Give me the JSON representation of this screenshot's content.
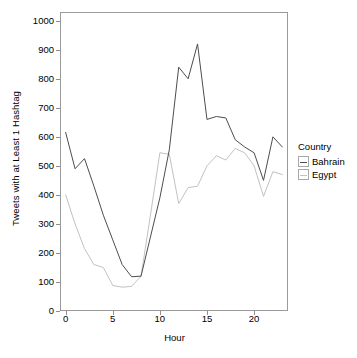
{
  "chart_data": {
    "type": "line",
    "title": "",
    "xlabel": "Hour",
    "ylabel": "Tweets with at Least 1 Hashtag",
    "xlim": [
      -0.6,
      23.6
    ],
    "ylim": [
      0,
      1030
    ],
    "xticks": [
      0,
      5,
      10,
      15,
      20
    ],
    "yticks": [
      0,
      100,
      200,
      300,
      400,
      500,
      600,
      700,
      800,
      900,
      1000
    ],
    "grid": false,
    "legend_position": "right",
    "legend_title": "Country",
    "x": [
      0,
      1,
      2,
      3,
      4,
      5,
      6,
      7,
      8,
      9,
      10,
      11,
      12,
      13,
      14,
      15,
      16,
      17,
      18,
      19,
      20,
      21,
      22,
      23
    ],
    "series": [
      {
        "name": "Bahrain",
        "color": "#4d4d4d",
        "values": [
          615,
          490,
          525,
          430,
          330,
          245,
          160,
          118,
          120,
          255,
          390,
          555,
          840,
          800,
          920,
          660,
          670,
          665,
          590,
          565,
          545,
          450,
          600,
          565
        ]
      },
      {
        "name": "Egypt",
        "color": "#c2c2c2",
        "values": [
          400,
          300,
          215,
          160,
          150,
          88,
          82,
          85,
          120,
          330,
          545,
          540,
          370,
          425,
          430,
          500,
          535,
          520,
          560,
          545,
          500,
          395,
          480,
          470
        ]
      }
    ]
  },
  "axes": {
    "ylabel": "Tweets with at Least 1 Hashtag",
    "xlabel": "Hour",
    "ytick_labels": [
      "1000",
      "900",
      "800",
      "700",
      "600",
      "500",
      "400",
      "300",
      "200",
      "100",
      "0"
    ],
    "xtick_labels": [
      "0",
      "5",
      "10",
      "15",
      "20"
    ]
  },
  "legend": {
    "title": "Country",
    "items": [
      {
        "label": "Bahrain",
        "color": "#4d4d4d"
      },
      {
        "label": "Egypt",
        "color": "#c2c2c2"
      }
    ]
  },
  "colors": {
    "panel_border": "#9a9a9a",
    "bahrain": "#4d4d4d",
    "egypt": "#c2c2c2",
    "background": "#ffffff"
  }
}
